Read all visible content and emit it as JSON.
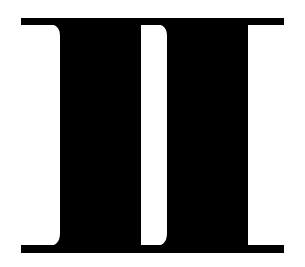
{
  "figure": {
    "glyph_text": "II",
    "colors": {
      "background": "#ffffff",
      "ink": "#000000"
    }
  }
}
